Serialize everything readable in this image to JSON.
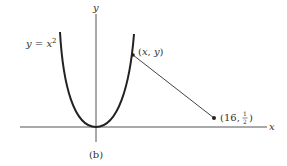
{
  "figure": {
    "caption": "(b)",
    "axes": {
      "x_label": "x",
      "y_label": "y"
    },
    "curve": {
      "label_lhs": "y",
      "label_eq": " = ",
      "label_var": "x",
      "label_exp": "2",
      "equation": "y = x^2"
    },
    "points": [
      {
        "label_open": "(",
        "label_x": "x",
        "label_sep": ", ",
        "label_y": "y",
        "label_close": ")",
        "description": "point on parabola"
      },
      {
        "label_prefix": "(16, ",
        "label_num": "1",
        "label_den": "2",
        "label_close": ")",
        "description": "fixed point (16, 1/2)"
      }
    ],
    "colors": {
      "ink": "#333333",
      "axis": "#555555",
      "curve": "#222222"
    }
  }
}
